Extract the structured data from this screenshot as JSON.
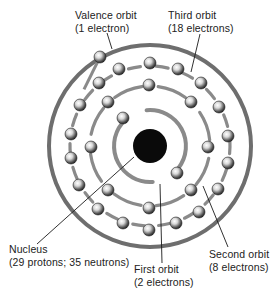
{
  "diagram": {
    "center": [
      150,
      146
    ],
    "colors": {
      "ring": "#6e6e6e",
      "nucleus": "#0a0a0a",
      "electron_light": "#f4f4f4",
      "electron_dark": "#2a2a2a",
      "trail": "#8a8a8a",
      "leader": "#1a1a1a",
      "text": "#222222"
    },
    "nucleus": {
      "radius": 17
    },
    "orbits": [
      {
        "name": "first",
        "radius": 36,
        "electron_count": 2,
        "electrons": [
          [
            123,
            118
          ],
          [
            177,
            173
          ]
        ]
      },
      {
        "name": "second",
        "radius": 60,
        "electron_count": 8,
        "electrons": [
          [
            149,
            85
          ],
          [
            191,
            102
          ],
          [
            208,
            147
          ],
          [
            191,
            190
          ],
          [
            149,
            208
          ],
          [
            108,
            190
          ],
          [
            91,
            147
          ],
          [
            108,
            102
          ]
        ]
      },
      {
        "name": "third",
        "radius": 80,
        "electron_count": 18,
        "electrons": [
          [
            119,
            69
          ],
          [
            150,
            63
          ],
          [
            178,
            69
          ],
          [
            201,
            83
          ],
          [
            219,
            107
          ],
          [
            228,
            136
          ],
          [
            228,
            163
          ],
          [
            218,
            189
          ],
          [
            199,
            212
          ],
          [
            176,
            223
          ],
          [
            149,
            230
          ],
          [
            123,
            223
          ],
          [
            98,
            209
          ],
          [
            79,
            185
          ],
          [
            71,
            158
          ],
          [
            71,
            134
          ],
          [
            80,
            105
          ],
          [
            99,
            83
          ]
        ]
      },
      {
        "name": "valence",
        "radius": 101,
        "electron_count": 1,
        "electrons": [
          [
            100,
            57
          ]
        ]
      }
    ]
  },
  "labels": {
    "valence": {
      "line1": "Valence orbit",
      "line2": "(1 electron)"
    },
    "third": {
      "line1": "Third orbit",
      "line2": "(18 electrons)"
    },
    "nucleus": {
      "line1": "Nucleus",
      "line2": "(29 protons; 35 neutrons)"
    },
    "first": {
      "line1": "First orbit",
      "line2": "(2 electrons)"
    },
    "second": {
      "line1": "Second orbit",
      "line2": "(8 electrons)"
    }
  },
  "leaders": {
    "valence": [
      107,
      33,
      112,
      49
    ],
    "third": [
      200,
      34,
      191,
      72
    ],
    "nucleus": [
      37,
      244,
      134,
      157
    ],
    "first": [
      162,
      263,
      160,
      184
    ],
    "second": [
      228,
      247,
      203,
      186
    ]
  }
}
